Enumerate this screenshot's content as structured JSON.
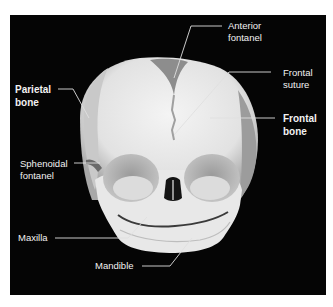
{
  "figure": {
    "background_color": "#050505",
    "label_color": "#f2f2f2",
    "labels": [
      {
        "id": "anterior-fontanel",
        "lines": [
          "Anterior",
          "fontanel"
        ],
        "bold": false
      },
      {
        "id": "frontal-suture",
        "lines": [
          "Frontal",
          "suture"
        ],
        "bold": false
      },
      {
        "id": "parietal-bone",
        "lines": [
          "Parietal",
          "bone"
        ],
        "bold": true
      },
      {
        "id": "frontal-bone",
        "lines": [
          "Frontal",
          "bone"
        ],
        "bold": true
      },
      {
        "id": "sphenoidal-fontanel",
        "lines": [
          "Sphenoidal",
          "fontanel"
        ],
        "bold": false
      },
      {
        "id": "maxilla",
        "lines": [
          "Maxilla"
        ],
        "bold": false
      },
      {
        "id": "mandible",
        "lines": [
          "Mandible"
        ],
        "bold": false
      }
    ]
  }
}
